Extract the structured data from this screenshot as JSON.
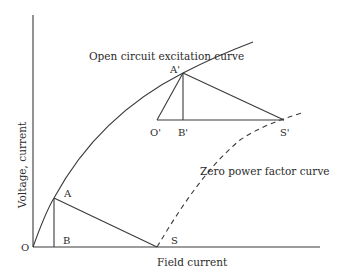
{
  "diagram": {
    "axes": {
      "x_label": "Field current",
      "y_label": "Voltage, current",
      "origin_label": "O"
    },
    "curves": {
      "occ_label": "Open circuit excitation curve",
      "zpf_label": "Zero power factor curve"
    },
    "points": {
      "A": "A",
      "B": "B",
      "S": "S",
      "A_prime": "A'",
      "B_prime": "B'",
      "O_prime": "O'",
      "S_prime": "S'"
    },
    "colors": {
      "line": "#3a3a3a",
      "text": "#2a2a2a",
      "background": "#ffffff"
    }
  }
}
